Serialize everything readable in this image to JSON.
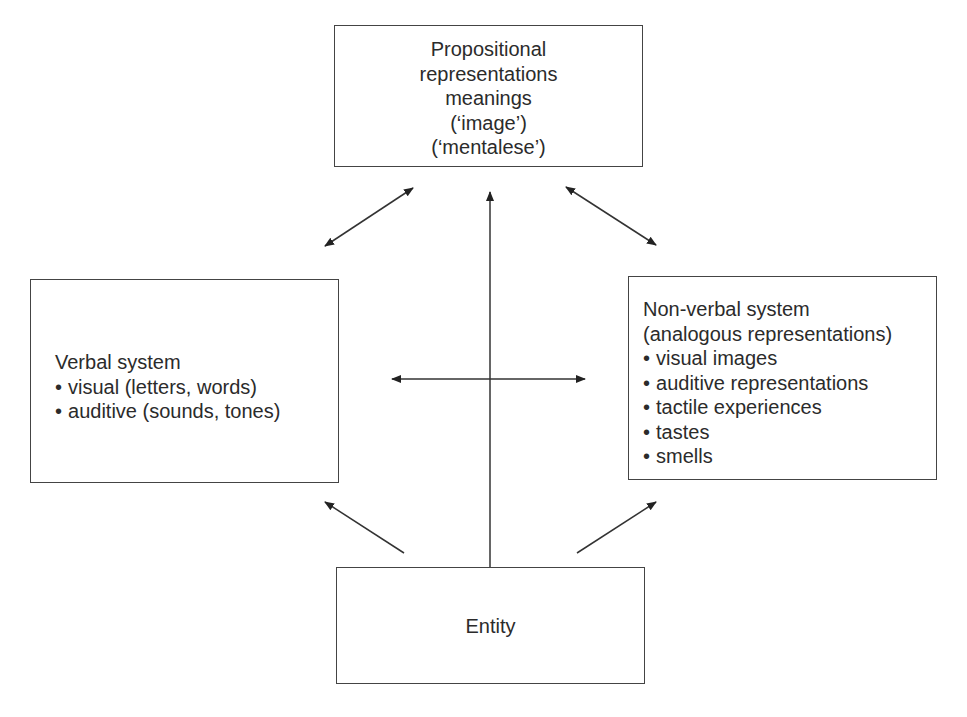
{
  "diagram": {
    "type": "dual-coding-model",
    "nodes": {
      "top": {
        "id": "propositional",
        "lines": [
          "Propositional",
          "representations",
          "meanings",
          "(‘image’)",
          "(‘mentalese’)"
        ]
      },
      "left": {
        "id": "verbal",
        "title": "Verbal system",
        "bullets": [
          "visual (letters, words)",
          "auditive (sounds, tones)"
        ]
      },
      "right": {
        "id": "non-verbal",
        "title": "Non-verbal system",
        "subtitle": "(analogous representations)",
        "bullets": [
          "visual images",
          "auditive representations",
          "tactile experiences",
          "tastes",
          "smells"
        ]
      },
      "bottom": {
        "id": "entity",
        "label": "Entity"
      }
    },
    "edges": [
      {
        "from": "verbal",
        "to": "propositional",
        "direction": "both"
      },
      {
        "from": "non-verbal",
        "to": "propositional",
        "direction": "both"
      },
      {
        "from": "entity",
        "to": "propositional",
        "direction": "forward"
      },
      {
        "from": "verbal",
        "to": "non-verbal",
        "direction": "both"
      },
      {
        "from": "entity",
        "to": "verbal",
        "direction": "forward"
      },
      {
        "from": "entity",
        "to": "non-verbal",
        "direction": "forward"
      }
    ],
    "colors": {
      "stroke": "#444444",
      "text": "#2b2b2b",
      "background": "#ffffff"
    }
  }
}
